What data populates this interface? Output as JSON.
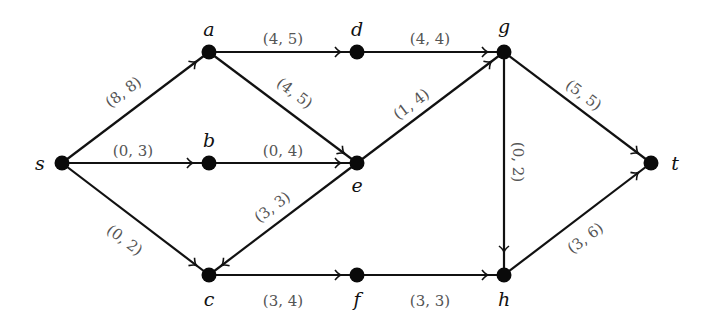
{
  "diagram": {
    "type": "flow-network",
    "nodes": [
      {
        "id": "s",
        "label": "s",
        "x": 62,
        "y": 163,
        "lx": 40,
        "ly": 170
      },
      {
        "id": "a",
        "label": "a",
        "x": 209,
        "y": 52,
        "lx": 209,
        "ly": 36
      },
      {
        "id": "d",
        "label": "d",
        "x": 357,
        "y": 52,
        "lx": 357,
        "ly": 36
      },
      {
        "id": "g",
        "label": "g",
        "x": 504,
        "y": 52,
        "lx": 504,
        "ly": 33
      },
      {
        "id": "b",
        "label": "b",
        "x": 209,
        "y": 163,
        "lx": 209,
        "ly": 147
      },
      {
        "id": "e",
        "label": "e",
        "x": 357,
        "y": 163,
        "lx": 357,
        "ly": 192
      },
      {
        "id": "t",
        "label": "t",
        "x": 651,
        "y": 163,
        "lx": 675,
        "ly": 170
      },
      {
        "id": "c",
        "label": "c",
        "x": 209,
        "y": 275,
        "lx": 209,
        "ly": 306
      },
      {
        "id": "f",
        "label": "f",
        "x": 357,
        "y": 275,
        "lx": 357,
        "ly": 306
      },
      {
        "id": "h",
        "label": "h",
        "x": 504,
        "y": 275,
        "lx": 504,
        "ly": 306
      }
    ],
    "edges": [
      {
        "from": "s",
        "to": "a",
        "label": "(8, 8)",
        "lx": 124,
        "ly": 93,
        "rot": -37
      },
      {
        "from": "s",
        "to": "b",
        "label": "(0, 3)",
        "lx": 133,
        "ly": 152,
        "rot": 0
      },
      {
        "from": "s",
        "to": "c",
        "label": "(0, 2)",
        "lx": 124,
        "ly": 241,
        "rot": 37
      },
      {
        "from": "a",
        "to": "d",
        "label": "(4, 5)",
        "lx": 283,
        "ly": 40,
        "rot": 0
      },
      {
        "from": "a",
        "to": "e",
        "label": "(4, 5)",
        "lx": 294,
        "ly": 94,
        "rot": 37
      },
      {
        "from": "b",
        "to": "e",
        "label": "(0, 4)",
        "lx": 283,
        "ly": 152,
        "rot": 0
      },
      {
        "from": "d",
        "to": "g",
        "label": "(4, 4)",
        "lx": 430,
        "ly": 40,
        "rot": 0
      },
      {
        "from": "e",
        "to": "g",
        "label": "(1, 4)",
        "lx": 412,
        "ly": 105,
        "rot": -37
      },
      {
        "from": "e",
        "to": "c",
        "label": "(3, 3)",
        "lx": 273,
        "ly": 208,
        "rot": -37
      },
      {
        "from": "g",
        "to": "t",
        "label": "(5, 5)",
        "lx": 583,
        "ly": 96,
        "rot": 37
      },
      {
        "from": "g",
        "to": "h",
        "label": "(0, 2)",
        "lx": 517,
        "ly": 162,
        "rot": 90
      },
      {
        "from": "c",
        "to": "f",
        "label": "(3, 4)",
        "lx": 283,
        "ly": 302,
        "rot": 0
      },
      {
        "from": "f",
        "to": "h",
        "label": "(3, 3)",
        "lx": 430,
        "ly": 302,
        "rot": 0
      },
      {
        "from": "h",
        "to": "t",
        "label": "(3, 6)",
        "lx": 586,
        "ly": 239,
        "rot": -37
      }
    ]
  }
}
